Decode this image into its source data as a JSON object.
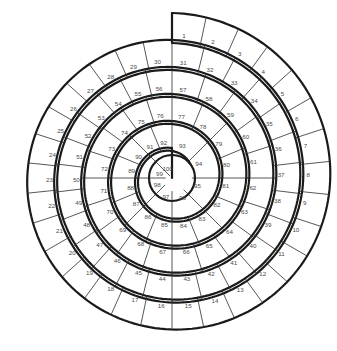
{
  "title": "",
  "figure": {
    "kind": "spiral-track-board",
    "background_color": "#ffffff",
    "track_line_color": "#1a1a1a",
    "divider_line_color": "#2b2b2b",
    "number_color": "#4a4a4a",
    "cell_count": 100,
    "first_cell": 1,
    "last_cell": 100,
    "center": {
      "x": 172,
      "y": 178
    },
    "hub_radius": 23,
    "spiral": {
      "start_angle_deg": -90,
      "turns": 4.35,
      "outer_radius": 165,
      "inner_radius": 30,
      "lane_width": 30
    },
    "rings": [
      {
        "name": "outer",
        "numbers": [
          1,
          2,
          3,
          4,
          5,
          6,
          7,
          8,
          9,
          10,
          11,
          12,
          13,
          14,
          15,
          16,
          17,
          18,
          19,
          20,
          21,
          22,
          23,
          24,
          25,
          26,
          27,
          28,
          29,
          30
        ]
      },
      {
        "name": "second",
        "numbers": [
          31,
          32,
          33,
          34,
          35,
          36,
          37,
          38,
          39,
          40,
          41,
          42,
          43,
          44,
          45,
          46,
          47,
          48,
          49,
          50,
          51,
          52,
          53,
          54,
          55,
          56
        ]
      },
      {
        "name": "third",
        "numbers": [
          57,
          58,
          59,
          60,
          61,
          62,
          63,
          64,
          65,
          66,
          67,
          68,
          69,
          70,
          71,
          72,
          73,
          74,
          75,
          76
        ]
      },
      {
        "name": "fourth",
        "numbers": [
          77,
          78,
          79,
          80,
          81,
          82,
          83,
          84,
          85,
          86,
          87,
          88,
          89,
          90,
          91,
          92
        ]
      },
      {
        "name": "inner",
        "numbers": [
          93,
          94,
          95,
          96,
          97,
          98,
          99,
          100
        ]
      }
    ],
    "numbers": [
      1,
      2,
      3,
      4,
      5,
      6,
      7,
      8,
      9,
      10,
      11,
      12,
      13,
      14,
      15,
      16,
      17,
      18,
      19,
      20,
      21,
      22,
      23,
      24,
      25,
      26,
      27,
      28,
      29,
      30,
      31,
      32,
      33,
      34,
      35,
      36,
      37,
      38,
      39,
      40,
      41,
      42,
      43,
      44,
      45,
      46,
      47,
      48,
      49,
      50,
      51,
      52,
      53,
      54,
      55,
      56,
      57,
      58,
      59,
      60,
      61,
      62,
      63,
      64,
      65,
      66,
      67,
      68,
      69,
      70,
      71,
      72,
      73,
      74,
      75,
      76,
      77,
      78,
      79,
      80,
      81,
      82,
      83,
      84,
      85,
      86,
      87,
      88,
      89,
      90,
      91,
      92,
      93,
      94,
      95,
      96,
      97,
      98,
      99,
      100
    ]
  }
}
